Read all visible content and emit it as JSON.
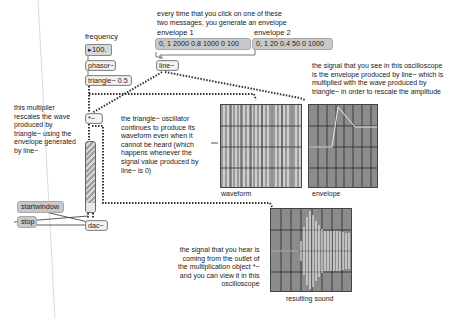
{
  "patch": {
    "frequency_label": "frequency",
    "frequency_value": "100.",
    "frequency_arrow": "▸",
    "phasor": "phasor~",
    "triangle": "triangle~ 0.5",
    "line": "line~",
    "multiply": "*~",
    "dac": "dac~",
    "startwindow": "startwindow",
    "stop": "stop",
    "envelope1_label": "envelope 1",
    "envelope1_msg": "0, 1 2000 0.8 1000 0 100",
    "envelope2_label": "envelope 2",
    "envelope2_msg": "0, 1 20 0.4 50 0 1000"
  },
  "comments": {
    "top": "every time that you click on one of these\ntwo messages, you generate an envelope",
    "right": "the signal that you see in this oscilloscope\nis the envelope produced by line~ which is\nmultiplied with the wave produced by\ntriangle~ in order to rescale the amplitude",
    "multiplier": "this multiplier\nrescales the wave\nproduced by\ntriangle~ using the\nenvelope generated\nby line~",
    "triangle_note": "the triangle~ oscillator\ncontinues to produce its\nwaveform even when it\ncannot be heard (which\nhappens whenever the\nsignal value produced by\nline~ is 0)",
    "output_note": "the signal that you hear is\ncoming from the outlet of\nthe multiplication object *~\nand you can view it in this\noscilloscope"
  },
  "scopes": {
    "waveform": "waveform",
    "envelope": "envelope",
    "result": "resulting sound"
  },
  "colors": {
    "scope_bg": "#8c8c8c",
    "scope_grid": "#2a2a2a",
    "scope_trace": "#e8e8e8",
    "message_bg": "#c8c8c8",
    "gain_stripe": "#b0b0b0"
  }
}
